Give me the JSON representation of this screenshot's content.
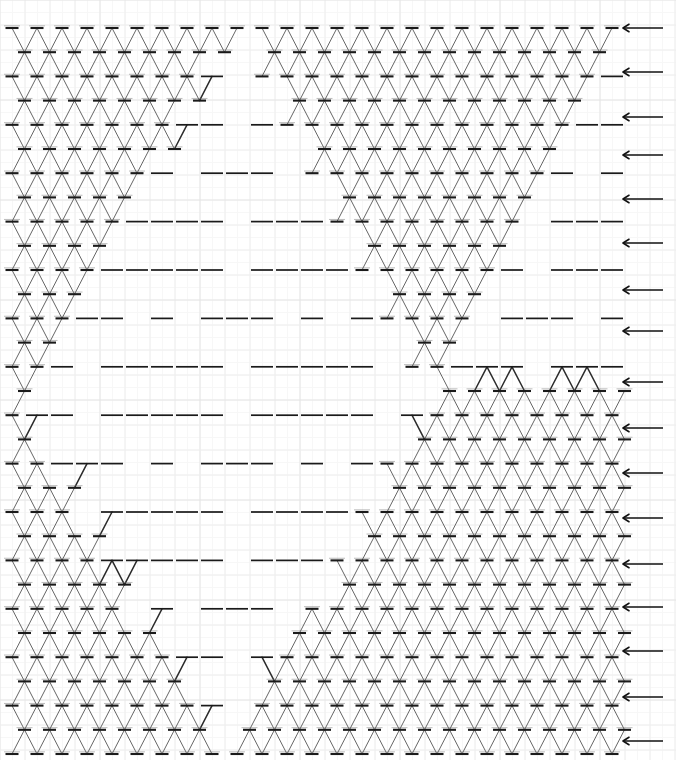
{
  "figure": {
    "kind": "lattice-spin-network-diagram",
    "domain_label": "Diagram",
    "width": 676,
    "height": 760,
    "background_color": "#ffffff"
  },
  "background_grid": {
    "visible": true,
    "minor_spacing": 12.5,
    "major_spacing": 25,
    "minor_color": "#f7f7f7",
    "major_color": "#eeeeee",
    "major_color_strong": "#e4e4e4",
    "line_width": 1
  },
  "lattice": {
    "node_count_estimate": 1100,
    "origin_x": 12,
    "origin_y": 28,
    "col_spacing": 25,
    "row_spacing": 24.2,
    "row_offset": 12.5,
    "rows": 31,
    "cols": 25,
    "edge_color": "#555555",
    "edge_width": 0.9,
    "node_color": "#1a1a1a",
    "node_bar_width": 13,
    "node_bar_height": 2.1,
    "node_tick_color": "#6a6a6a",
    "sparse_edge_color": "#2b2b2b",
    "sparse_edge_width": 1.5,
    "sparse_node_bar_width": 22,
    "sparse_node_bar_height": 1.7,
    "description": "Triangular lattice of horizontal-bar nodes joined by diagonal edges. Dense X-crossed regions occupy three large triangles (upper-left, upper-right, lower-right) plus a lower-left triangle; between them run sparse single-diagonal chains forming large empty triangles and a central diamond/hourglass."
  },
  "regions": [
    {
      "name": "dense-upper-left-triangle",
      "style": "dense"
    },
    {
      "name": "dense-upper-right-triangle",
      "style": "dense"
    },
    {
      "name": "dense-lower-left-triangle",
      "style": "dense"
    },
    {
      "name": "dense-lower-right-triangle",
      "style": "dense"
    },
    {
      "name": "sparse-central-hourglass",
      "style": "sparse"
    },
    {
      "name": "sparse-right-margin-chains",
      "style": "sparse"
    }
  ],
  "arrows": {
    "count": 17,
    "direction": "left",
    "color": "#111111",
    "shaft_length": 40,
    "line_width": 1.6,
    "head_size": 6,
    "tip_x": 623,
    "y_positions": [
      28,
      72,
      117,
      155,
      199,
      243,
      290,
      331,
      382,
      428,
      473,
      518,
      564,
      607,
      651,
      697,
      741
    ]
  }
}
